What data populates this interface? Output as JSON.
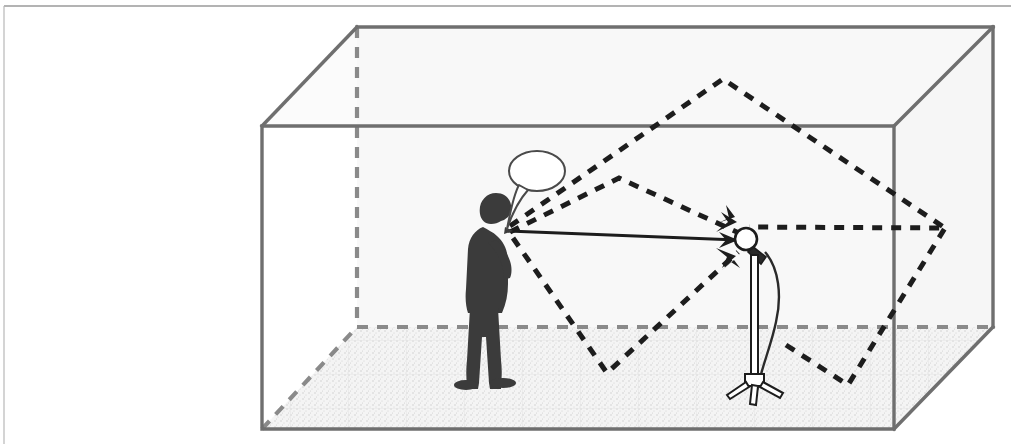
{
  "figure": {
    "caption": "",
    "background_color": "#ffffff"
  },
  "page_rules": {
    "top_rule": {
      "name": "top-horizontal-rule",
      "color": "#9a9a9a",
      "x1": 4,
      "y1": 6,
      "x2": 1011,
      "y2": 6,
      "width": 1.4
    },
    "left_rule": {
      "name": "left-vertical-rule",
      "color": "#b0b0b0",
      "x1": 4,
      "y1": 6,
      "x2": 4,
      "y2": 444,
      "width": 1.2
    }
  },
  "room": {
    "label": "rectangular-room-box",
    "edge_color": "#6f6f6f",
    "edge_color_light": "#9b9b9b",
    "wall_fill": "#fdfdfd",
    "back_wall_fill": "#f7f7f7",
    "ceiling_fill": "#fbfbfb",
    "floor_fill": "#f1f1f1",
    "edge_width": 3.2,
    "hidden_edge_dash": "11 9",
    "vertices": {
      "front_top_left": [
        262,
        126
      ],
      "front_top_right": [
        894,
        126
      ],
      "front_bottom_left": [
        262,
        429
      ],
      "front_bottom_right": [
        894,
        429
      ],
      "back_top_left": [
        357,
        27
      ],
      "back_top_right": [
        993,
        27
      ],
      "back_bottom_left": [
        357,
        327
      ],
      "back_bottom_right": [
        993,
        327
      ]
    },
    "floor_texture": {
      "name": "speckled-floor",
      "dot_color": "#c8c8c8",
      "grid_color": "#e2e2e2"
    }
  },
  "person": {
    "label": "speaking-person-silhouette",
    "fill": "#3b3b3b",
    "position": {
      "x": 455,
      "y": 205,
      "height": 180
    },
    "facing": "right",
    "mouth_point": [
      506,
      232
    ]
  },
  "speech_bubble": {
    "label": "speech-bubble",
    "stroke": "#4a4a4a",
    "fill": "#ffffff",
    "stroke_width": 2,
    "center": [
      537,
      171
    ],
    "rx": 28,
    "ry": 20,
    "tail_tip": [
      508,
      228
    ]
  },
  "microphone": {
    "label": "microphone-on-tripod-stand",
    "stroke": "#1d1d1d",
    "fill": "#ffffff",
    "head_center": [
      746,
      239
    ],
    "head_radius": 11,
    "stand_base_y": 383,
    "cable": {
      "label": "microphone-cable",
      "stroke": "#2a2a2a"
    }
  },
  "paths": {
    "direct": {
      "name": "direct-sound-path",
      "style": "solid",
      "color": "#1d1d1d",
      "width": 3,
      "points": [
        [
          508,
          232
        ],
        [
          735,
          240
        ]
      ],
      "arrow": true
    },
    "ceiling_reflection": {
      "name": "ceiling-reflection-path",
      "style": "dashed",
      "color": "#1d1d1d",
      "width": 5,
      "dash": "10 9",
      "points": [
        [
          510,
          226
        ],
        [
          723,
          79
        ],
        [
          945,
          228
        ],
        [
          749,
          227
        ]
      ],
      "arrow": true
    },
    "upper_short_reflection": {
      "name": "upper-wall-reflection-path",
      "style": "dashed",
      "color": "#1d1d1d",
      "width": 5,
      "dash": "10 9",
      "points": [
        [
          510,
          232
        ],
        [
          619,
          178
        ],
        [
          739,
          233
        ]
      ],
      "arrow": true
    },
    "floor_reflection": {
      "name": "floor-reflection-path",
      "style": "dashed",
      "color": "#1d1d1d",
      "width": 5,
      "dash": "10 9",
      "points": [
        [
          513,
          238
        ],
        [
          607,
          373
        ],
        [
          738,
          252
        ]
      ],
      "arrow": true
    },
    "right_floor_reflection": {
      "name": "right-floor-reflection-path",
      "style": "dashed",
      "color": "#1d1d1d",
      "width": 5,
      "dash": "10 9",
      "points": [
        [
          786,
          345
        ],
        [
          848,
          385
        ],
        [
          945,
          228
        ]
      ]
    }
  },
  "arrowheads": {
    "name": "converging-arrowheads-at-microphone",
    "color": "#1d1d1d",
    "count": 3,
    "targets": [
      [
        736,
        222
      ],
      [
        735,
        240
      ],
      [
        736,
        258
      ]
    ]
  }
}
